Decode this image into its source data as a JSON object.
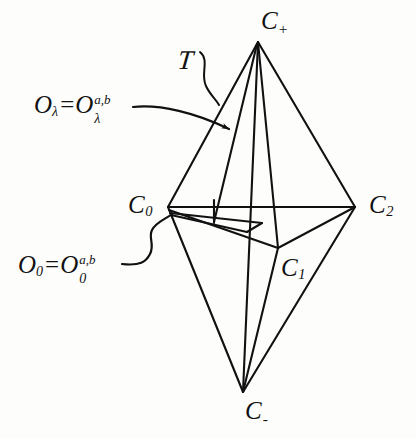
{
  "figure": {
    "kind": "bipyramid-diagram",
    "background_color": "#fdfdfc",
    "ink_color": "#111111",
    "width": 416,
    "height": 438
  },
  "vertices": [
    {
      "id": "c-plus",
      "base": "C",
      "script": "+",
      "script_kind": "sign",
      "label": "C+",
      "x": 258,
      "y": 42,
      "label_x": 261,
      "label_y": 8
    },
    {
      "id": "c-zero",
      "base": "C",
      "script": "0",
      "script_kind": "sub",
      "label": "C0",
      "x": 168,
      "y": 207,
      "label_x": 128,
      "label_y": 192
    },
    {
      "id": "c-two",
      "base": "C",
      "script": "2",
      "script_kind": "sub",
      "label": "C2",
      "x": 355,
      "y": 207,
      "label_x": 369,
      "label_y": 192
    },
    {
      "id": "c-one",
      "base": "C",
      "script": "1",
      "script_kind": "sub",
      "label": "C1",
      "x": 278,
      "y": 248,
      "label_x": 281,
      "label_y": 255
    },
    {
      "id": "c-minus",
      "base": "C",
      "script": "-",
      "script_kind": "sign",
      "label": "C-",
      "x": 243,
      "y": 392,
      "label_x": 245,
      "label_y": 398
    }
  ],
  "annotations": {
    "region_t": {
      "id": "script-t",
      "text": "T",
      "meaning": "tetrahedron-region",
      "x": 178,
      "y": 45,
      "pointer_tip_x": 218,
      "pointer_tip_y": 104
    },
    "o_lambda": {
      "id": "o-lambda",
      "base": "O",
      "sub": "λ",
      "equals": "=",
      "second_base": "O",
      "second_sub": "λ",
      "second_sup": "a,b",
      "text": "Oλ = Oλ a,b",
      "x": 34,
      "y": 92,
      "arrow_tip_x": 232,
      "arrow_tip_y": 130
    },
    "o_zero": {
      "id": "o-zero",
      "base": "O",
      "sub": "0",
      "equals": "=",
      "second_base": "O",
      "second_sub": "0",
      "second_sup": "a,b",
      "text": "O0 = O0 a,b",
      "x": 18,
      "y": 252,
      "pointer_tip_x": 166,
      "pointer_tip_y": 238
    }
  },
  "edges": [
    {
      "name": "c-plus-to-c-zero",
      "from": "c-plus",
      "to": "c-zero"
    },
    {
      "name": "c-plus-to-c-two",
      "from": "c-plus",
      "to": "c-two"
    },
    {
      "name": "c-plus-to-c-one",
      "from": "c-plus",
      "to": "c-one"
    },
    {
      "name": "c-plus-to-c-minus",
      "from": "c-plus",
      "to": "c-minus"
    },
    {
      "name": "c-zero-to-c-two",
      "from": "c-zero",
      "to": "c-two"
    },
    {
      "name": "c-zero-to-c-one",
      "from": "c-zero",
      "to": "c-one"
    },
    {
      "name": "c-one-to-c-two",
      "from": "c-one",
      "to": "c-two"
    },
    {
      "name": "c-minus-to-c-zero",
      "from": "c-minus",
      "to": "c-zero"
    },
    {
      "name": "c-minus-to-c-two",
      "from": "c-minus",
      "to": "c-two"
    },
    {
      "name": "c-minus-to-c-one",
      "from": "c-minus",
      "to": "c-one"
    },
    {
      "name": "inner-fold-edge",
      "from": "c-zero",
      "to": "c-one"
    }
  ],
  "caption_note": ""
}
